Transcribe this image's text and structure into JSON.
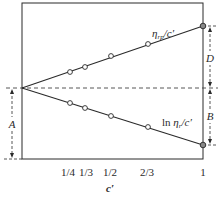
{
  "diagram": {
    "frame": {
      "left": 22,
      "right": 203,
      "top": 3,
      "bottom": 159
    },
    "origin": {
      "x": 22,
      "y": 88
    },
    "colors": {
      "line": "#2a2a2a",
      "dash": "#444444",
      "marker_fill": "#ffffff"
    },
    "lines": [
      {
        "label": "ηᵣₚ/c′",
        "label_main": "η",
        "label_sub": "rp",
        "label_tail": "/c′",
        "end": {
          "x": 203,
          "y": 26
        },
        "points": [
          {
            "x": 70,
            "y": 72
          },
          {
            "x": 85,
            "y": 67
          },
          {
            "x": 111,
            "y": 56
          },
          {
            "x": 148,
            "y": 44
          },
          {
            "x": 203,
            "y": 26
          }
        ]
      },
      {
        "label": "ln ηᵣ/c′",
        "label_prefix": "ln ",
        "label_main": "η",
        "label_sub": "r",
        "label_tail": "/c′",
        "end": {
          "x": 203,
          "y": 145
        },
        "points": [
          {
            "x": 70,
            "y": 103
          },
          {
            "x": 85,
            "y": 108
          },
          {
            "x": 111,
            "y": 116
          },
          {
            "x": 148,
            "y": 127
          },
          {
            "x": 203,
            "y": 145
          }
        ]
      }
    ],
    "dimension_labels": {
      "A": "A",
      "B": "B",
      "D": "D"
    },
    "x_axis": {
      "label": "c′",
      "ticks": [
        {
          "label": "1/4",
          "x": 68
        },
        {
          "label": "1/3",
          "x": 86
        },
        {
          "label": "1/2",
          "x": 110
        },
        {
          "label": "2/3",
          "x": 147
        },
        {
          "label": "1",
          "x": 203
        }
      ]
    }
  }
}
